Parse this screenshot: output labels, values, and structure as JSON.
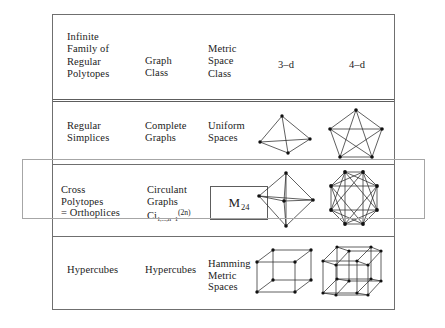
{
  "document": {
    "title": "Infinite Families of Regular Polytopes, Graph Classes and Metric Space Classes"
  },
  "table": {
    "columns": [
      "Infinite\nFamily of\nRegular\nPolytopes",
      "Graph\nClass",
      "Metric\nSpace\nClass",
      "3–d",
      "4–d"
    ],
    "rows": [
      {
        "family": "Regular\nSimplices",
        "graph_class": "Complete\nGraphs",
        "metric_space_class": "Uniform\nSpaces",
        "figure_3d": "tetrahedron-k4-graph",
        "figure_4d": "pentagon-k5-graph"
      },
      {
        "family": "Cross\nPolytopes\n= Orthoplices",
        "graph_class": "Circulant\nGraphs",
        "graph_class_formula": {
          "base": "Ci",
          "subscript": "1,...,n−1",
          "superscript": "(2n)"
        },
        "metric_space_class_box": {
          "symbol": "M",
          "subscript": "24"
        },
        "figure_3d": "octahedron-graph",
        "figure_4d": "octagon-16-cell-graph"
      },
      {
        "family": "Hypercubes",
        "graph_class": "Hypercubes",
        "metric_space_class": "Hamming\nMetric\nSpaces",
        "figure_3d": "cube-graph",
        "figure_4d": "tesseract-graph"
      }
    ]
  },
  "annotation": {
    "highlight_row": "Cross Polytopes = Orthoplices",
    "highlight_color": "#a6a6a6"
  },
  "style": {
    "rule_color": "#6f6f6f",
    "text_color": "#1c1c1c",
    "figure_stroke": "#2b2b2b"
  }
}
